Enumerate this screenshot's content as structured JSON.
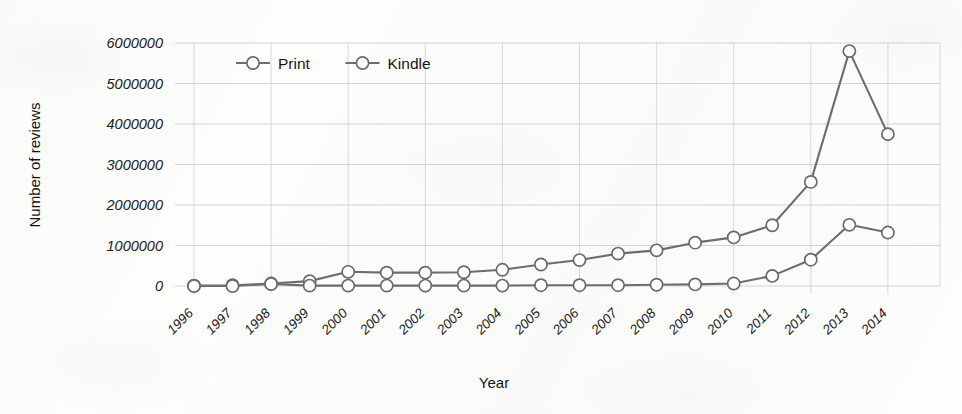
{
  "chart_data": {
    "type": "line",
    "title": "",
    "xlabel": "Year",
    "ylabel": "Number of reviews",
    "categories": [
      "1996",
      "1997",
      "1998",
      "1999",
      "2000",
      "2001",
      "2002",
      "2003",
      "2004",
      "2005",
      "2006",
      "2007",
      "2008",
      "2009",
      "2010",
      "2011",
      "2012",
      "2013",
      "2014"
    ],
    "series": [
      {
        "name": "Print",
        "values": [
          10000,
          20000,
          60000,
          120000,
          350000,
          330000,
          330000,
          340000,
          400000,
          530000,
          640000,
          800000,
          880000,
          1070000,
          1200000,
          1500000,
          2570000,
          5800000,
          3750000
        ]
      },
      {
        "name": "Kindle",
        "values": [
          0,
          0,
          50000,
          10000,
          10000,
          10000,
          10000,
          10000,
          10000,
          20000,
          20000,
          20000,
          30000,
          40000,
          60000,
          250000,
          650000,
          1510000,
          1320000
        ]
      }
    ],
    "ytick_labels": [
      "0",
      "1000000",
      "2000000",
      "3000000",
      "4000000",
      "5000000",
      "6000000"
    ],
    "ytick_values": [
      0,
      1000000,
      2000000,
      3000000,
      4000000,
      5000000,
      6000000
    ],
    "ylim": [
      0,
      6000000
    ],
    "xtick_rotation_deg": -45,
    "grid": "both",
    "grid_vertical_every_n_categories": 2,
    "legend": {
      "position": "top-left-inside",
      "entries": [
        {
          "label": "Print",
          "marker": "open-circle",
          "color": "#6d6d6d"
        },
        {
          "label": "Kindle",
          "marker": "open-circle",
          "color": "#6d6d6d"
        }
      ]
    },
    "colors": {
      "line": "#6d6d6d",
      "marker_fill": "#ffffff",
      "marker_stroke": "#6a6a6a",
      "grid": "#c9c9c9",
      "text": "#1b1b1b",
      "background": "#fdfdfc"
    }
  }
}
